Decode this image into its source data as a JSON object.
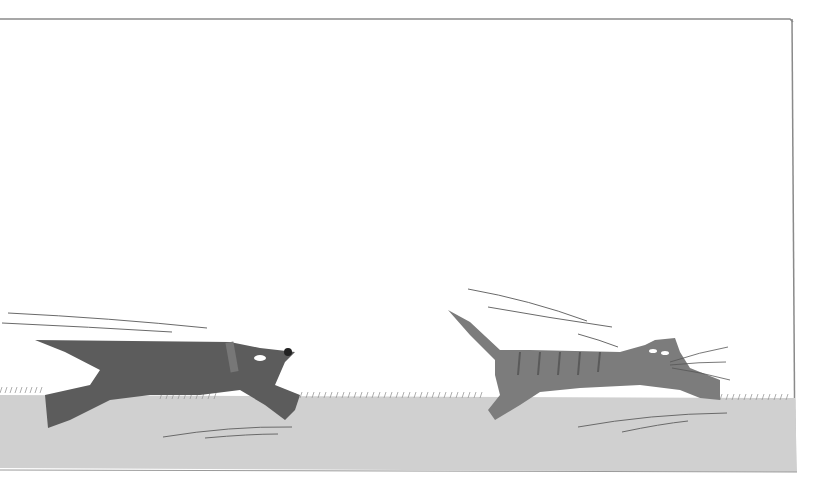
{
  "illustration": {
    "subject": "A dark gray dog chasing a striped tabby cat across grass",
    "colors": {
      "background": "#ffffff",
      "ground": "#cfcfcf",
      "frame": "#7a7a7a",
      "dog": "#5e5e5e",
      "cat": "#7c7c7c",
      "motion_lines": "#6a6a6a"
    },
    "characters": [
      {
        "name": "dog",
        "position": "left",
        "action": "running"
      },
      {
        "name": "cat",
        "position": "right",
        "action": "fleeing"
      }
    ]
  }
}
